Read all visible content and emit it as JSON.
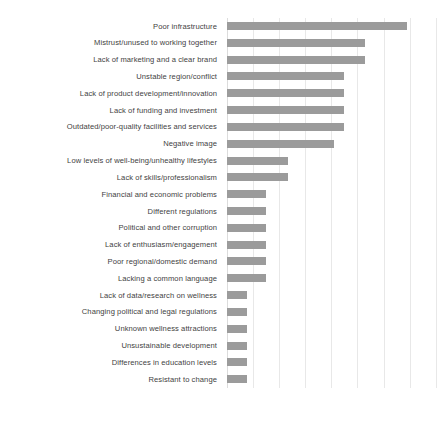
{
  "chart_data": {
    "type": "bar",
    "orientation": "horizontal",
    "title": "",
    "subtitle": "",
    "xlabel": "",
    "ylabel": "",
    "grid": true,
    "legend": false,
    "legend_position": "none",
    "xlim": [
      0,
      8.2
    ],
    "xticks": [
      0,
      1,
      2,
      3,
      4,
      5,
      6,
      7,
      8
    ],
    "xtick_labels": [],
    "bar_color": "#9b9b9b",
    "gridline_color": "#e8e8e8",
    "label_color": "#3f3f3f",
    "categories": [
      "Poor infrastructure",
      "Mistrust/unused to working together",
      "Lack of marketing and a clear brand",
      "Unstable region/conflict",
      "Lack of product development/innovation",
      "Lack of funding and investment",
      "Outdated/poor-quality facilities and services",
      "Negative image",
      "Low levels of well-being/unhealthy lifestyles",
      "Lack of skills/professionalism",
      "Financial and economic problems",
      "Different regulations",
      "Political and other corruption",
      "Lack of enthusiasm/engagement",
      "Poor regional/domestic demand",
      "Lacking a common language",
      "Lack of data/research on wellness",
      "Changing political and legal regulations",
      "Unknown wellness attractions",
      "Unsustainable development",
      "Differences in education levels",
      "Resistant to change"
    ],
    "values": [
      6.9,
      5.3,
      5.3,
      4.5,
      4.5,
      4.5,
      4.5,
      4.1,
      2.35,
      2.35,
      1.5,
      1.5,
      1.5,
      1.5,
      1.5,
      1.5,
      0.75,
      0.75,
      0.75,
      0.75,
      0.75,
      0.75
    ]
  }
}
